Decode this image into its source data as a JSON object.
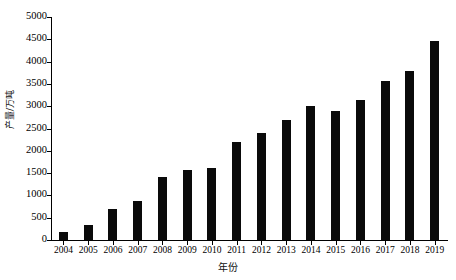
{
  "chart_data": {
    "type": "bar",
    "title": "",
    "xlabel": "年份",
    "ylabel": "产量/万吨",
    "categories": [
      "2004",
      "2005",
      "2006",
      "2007",
      "2008",
      "2009",
      "2010",
      "2011",
      "2012",
      "2013",
      "2014",
      "2015",
      "2016",
      "2017",
      "2018",
      "2019"
    ],
    "values": [
      180,
      340,
      700,
      870,
      1410,
      1580,
      1620,
      2200,
      2390,
      2680,
      3000,
      2890,
      3130,
      3570,
      3800,
      4470
    ],
    "ylim": [
      0,
      5000
    ],
    "ytick_values": [
      0,
      500,
      1000,
      1500,
      2000,
      2500,
      3000,
      3500,
      4000,
      4500,
      5000
    ],
    "ytick_labels": [
      "0",
      "500",
      "1000",
      "1500",
      "2000",
      "2500",
      "3000",
      "3500",
      "4000",
      "4500",
      "5000"
    ],
    "grid": false,
    "legend": false,
    "bar_color": "#0a0a0a",
    "axis_color": "#000000",
    "background": "#ffffff"
  }
}
